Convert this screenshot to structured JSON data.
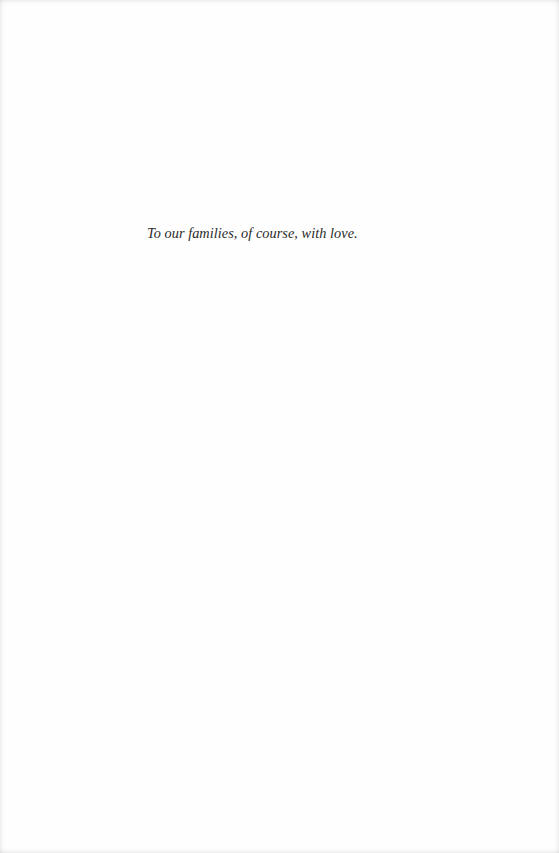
{
  "page": {
    "background": "#fefefe",
    "dedication": {
      "text": "To our families, of course, with love.",
      "color": "#2a2a2a"
    }
  }
}
